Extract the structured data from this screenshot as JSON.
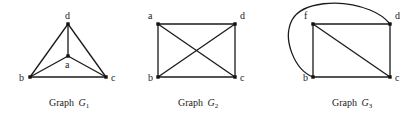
{
  "graphs": [
    {
      "caption": "Graph",
      "caption_var": "G",
      "caption_sub": "1",
      "nodes": [
        {
          "id": "d",
          "label": "d"
        },
        {
          "id": "a",
          "label": "a"
        },
        {
          "id": "b",
          "label": "b"
        },
        {
          "id": "c",
          "label": "c"
        }
      ],
      "edges": [
        [
          "d",
          "a"
        ],
        [
          "d",
          "b"
        ],
        [
          "d",
          "c"
        ],
        [
          "a",
          "b"
        ],
        [
          "a",
          "c"
        ],
        [
          "b",
          "c"
        ]
      ]
    },
    {
      "caption": "Graph",
      "caption_var": "G",
      "caption_sub": "2",
      "nodes": [
        {
          "id": "a",
          "label": "a"
        },
        {
          "id": "d",
          "label": "d"
        },
        {
          "id": "b",
          "label": "b"
        },
        {
          "id": "c",
          "label": "c"
        }
      ],
      "edges": [
        [
          "a",
          "d"
        ],
        [
          "a",
          "b"
        ],
        [
          "a",
          "c"
        ],
        [
          "d",
          "b"
        ],
        [
          "d",
          "c"
        ],
        [
          "b",
          "c"
        ]
      ]
    },
    {
      "caption": "Graph",
      "caption_var": "G",
      "caption_sub": "3",
      "nodes": [
        {
          "id": "f",
          "label": "f"
        },
        {
          "id": "d",
          "label": "d"
        },
        {
          "id": "b",
          "label": "b"
        },
        {
          "id": "c",
          "label": "c"
        }
      ],
      "edges": [
        [
          "f",
          "d"
        ],
        [
          "f",
          "b"
        ],
        [
          "f",
          "c"
        ],
        [
          "d",
          "c"
        ],
        [
          "b",
          "c"
        ],
        [
          "b",
          "d",
          "curved"
        ]
      ]
    }
  ]
}
